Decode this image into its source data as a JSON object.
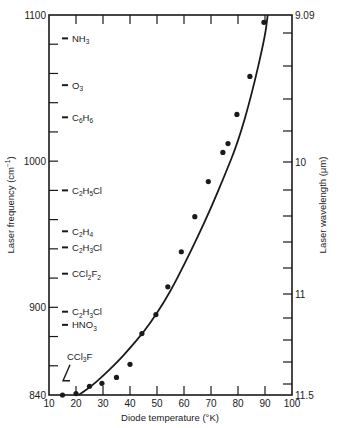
{
  "chart_data": {
    "type": "scatter",
    "title": "",
    "xlabel": "Diode temperature (°K)",
    "ylabel": "Laser frequency (cm⁻¹)",
    "y2label": "Laser wavelength (μm)",
    "xlim": [
      10,
      100
    ],
    "ylim": [
      840,
      1100
    ],
    "grid": false,
    "legend": "none",
    "x_ticks": [
      10,
      20,
      30,
      40,
      50,
      60,
      70,
      80,
      90,
      100
    ],
    "y_tick_labels": [
      "840",
      "900",
      "1000",
      "1100"
    ],
    "y_minor_step": 20,
    "y2_tick_labels": [
      "9.09",
      "10",
      "11",
      "11.5"
    ],
    "series": [
      {
        "name": "measured",
        "kind": "points",
        "x": [
          15,
          20,
          25,
          29.6,
          35,
          40,
          44.4,
          49.6,
          54,
          59,
          64,
          69,
          74.4,
          76.3,
          79.6,
          84.4,
          89.6
        ],
        "y": [
          840,
          841,
          846,
          848,
          852,
          861,
          882,
          895,
          914,
          938,
          962,
          986,
          1006,
          1012,
          1032,
          1058,
          1095
        ]
      },
      {
        "name": "fit",
        "kind": "curve",
        "x": [
          21,
          25,
          30,
          35,
          40,
          45,
          50,
          55,
          60,
          65,
          70,
          75,
          80,
          85,
          90,
          91
        ],
        "y": [
          840,
          845,
          853,
          862,
          872,
          883,
          896,
          911,
          929,
          948,
          968,
          990,
          1013,
          1045,
          1085,
          1100
        ]
      }
    ],
    "annotations": [
      {
        "label": "NH3",
        "sub": [
          "NH",
          "3",
          ""
        ],
        "y": 1084
      },
      {
        "label": "O3",
        "sub": [
          "O",
          "3",
          ""
        ],
        "y": 1052
      },
      {
        "label": "C6H6",
        "sub": [
          "C",
          "6",
          "H",
          "6"
        ],
        "y": 1030
      },
      {
        "label": "C2H5Cl",
        "sub": [
          "C",
          "2",
          "H",
          "5",
          "Cl"
        ],
        "y": 980
      },
      {
        "label": "C2H4",
        "sub": [
          "C",
          "2",
          "H",
          "4"
        ],
        "y": 952
      },
      {
        "label": "C2H3Cl",
        "sub": [
          "C",
          "2",
          "H",
          "3",
          "Cl"
        ],
        "y": 941
      },
      {
        "label": "CCl2F2",
        "sub": [
          "CCl",
          "2",
          "F",
          "2"
        ],
        "y": 923
      },
      {
        "label": "C2H3Cl",
        "sub": [
          "C",
          "2",
          "H",
          "3",
          "Cl"
        ],
        "y": 897
      },
      {
        "label": "HNO3",
        "sub": [
          "HNO",
          "3",
          ""
        ],
        "y": 888
      },
      {
        "label": "CCl3F",
        "sub": [
          "CCl",
          "3",
          "F"
        ],
        "y": 847,
        "arrow": true
      }
    ]
  },
  "labels": {
    "xlabel": "Diode temperature (°K)",
    "ylabel_main": "Laser frequency (cm",
    "ylabel_sup": "−1",
    "ylabel_close": ")",
    "y2label": "Laser wavelength (μm)"
  }
}
